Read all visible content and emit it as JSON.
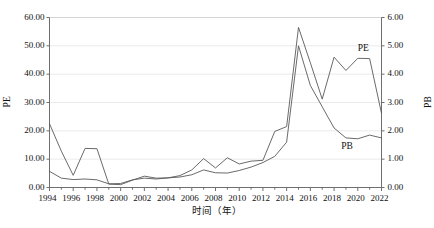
{
  "chart_data": {
    "type": "line",
    "title": "",
    "xlabel": "时间（年）",
    "ylabel": "PE",
    "y2label": "PB",
    "grid": true,
    "legend_position": "inline-annotation",
    "x": [
      1994,
      1995,
      1996,
      1997,
      1998,
      1999,
      2000,
      2001,
      2002,
      2003,
      2004,
      2005,
      2006,
      2007,
      2008,
      2009,
      2010,
      2011,
      2012,
      2013,
      2014,
      2015,
      2016,
      2017,
      2018,
      2019,
      2020,
      2021,
      2022
    ],
    "xtick_labels": [
      "1994",
      "1996",
      "1998",
      "2000",
      "2002",
      "2004",
      "2006",
      "2008",
      "2010",
      "2012",
      "2014",
      "2016",
      "2018",
      "2020",
      "2022"
    ],
    "xlim": [
      1994,
      2022
    ],
    "ylim": [
      0,
      60
    ],
    "ytick_labels": [
      "0.00",
      "10.00",
      "20.00",
      "30.00",
      "40.00",
      "50.00",
      "60.00"
    ],
    "y2lim": [
      0,
      6
    ],
    "y2tick_labels": [
      "0.00",
      "1.00",
      "2.00",
      "3.00",
      "4.00",
      "5.00",
      "6.00"
    ],
    "series": [
      {
        "name": "PE",
        "axis": "left",
        "color": "#595959",
        "label_text": "PE",
        "values": [
          22.5,
          12.8,
          4.3,
          13.8,
          13.7,
          1.2,
          1.0,
          2.6,
          4.0,
          3.3,
          3.4,
          4.2,
          6.2,
          10.2,
          6.9,
          10.5,
          8.3,
          9.3,
          9.6,
          19.8,
          21.5,
          56.5,
          44.0,
          31.2,
          46.0,
          41.3,
          45.6,
          45.5,
          26.2
        ]
      },
      {
        "name": "PB",
        "axis": "right",
        "color": "#595959",
        "label_text": "PB",
        "values": [
          0.57,
          0.33,
          0.28,
          0.3,
          0.27,
          0.13,
          0.14,
          0.27,
          0.33,
          0.3,
          0.34,
          0.37,
          0.45,
          0.62,
          0.52,
          0.51,
          0.6,
          0.72,
          0.88,
          1.1,
          1.6,
          5.0,
          3.6,
          2.85,
          2.1,
          1.75,
          1.72,
          1.85,
          1.75
        ]
      }
    ],
    "annotations": [
      {
        "text": "PE",
        "x": 2020.0,
        "value_axis": "left",
        "value": 48.5
      },
      {
        "text": "PB",
        "x": 2018.6,
        "value_axis": "right",
        "value": 1.38
      }
    ]
  }
}
